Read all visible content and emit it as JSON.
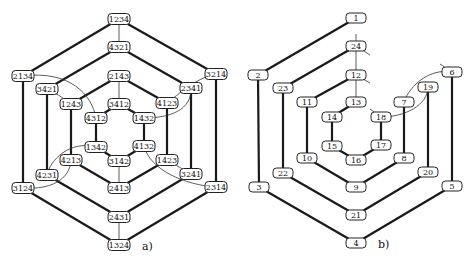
{
  "diagram_a": {
    "caption": "a)",
    "nodes": [
      {
        "id": "1234",
        "label": "1234",
        "x": 119,
        "y": 19
      },
      {
        "id": "4321",
        "label": "4321",
        "x": 119,
        "y": 47
      },
      {
        "id": "2134",
        "label": "2134",
        "x": 23,
        "y": 76
      },
      {
        "id": "3214",
        "label": "3214",
        "x": 216,
        "y": 74
      },
      {
        "id": "2143",
        "label": "2143",
        "x": 119,
        "y": 76
      },
      {
        "id": "3421",
        "label": "3421",
        "x": 47,
        "y": 89
      },
      {
        "id": "2341",
        "label": "2341",
        "x": 191,
        "y": 88
      },
      {
        "id": "1243",
        "label": "1243",
        "x": 71,
        "y": 104
      },
      {
        "id": "3412",
        "label": "3412",
        "x": 119,
        "y": 104
      },
      {
        "id": "4123",
        "label": "4123",
        "x": 167,
        "y": 103
      },
      {
        "id": "4312",
        "label": "4312",
        "x": 96,
        "y": 118
      },
      {
        "id": "1432",
        "label": "1432",
        "x": 144,
        "y": 118
      },
      {
        "id": "1342",
        "label": "1342",
        "x": 96,
        "y": 147
      },
      {
        "id": "4132",
        "label": "4132",
        "x": 144,
        "y": 146
      },
      {
        "id": "4213",
        "label": "4213",
        "x": 71,
        "y": 160
      },
      {
        "id": "3142",
        "label": "3142",
        "x": 119,
        "y": 161
      },
      {
        "id": "1423",
        "label": "1423",
        "x": 167,
        "y": 160
      },
      {
        "id": "4231",
        "label": "4231",
        "x": 47,
        "y": 175
      },
      {
        "id": "3241",
        "label": "3241",
        "x": 191,
        "y": 174
      },
      {
        "id": "3124",
        "label": "3124",
        "x": 23,
        "y": 188
      },
      {
        "id": "2413",
        "label": "2413",
        "x": 119,
        "y": 188
      },
      {
        "id": "2314",
        "label": "2314",
        "x": 216,
        "y": 187
      },
      {
        "id": "2431",
        "label": "2431",
        "x": 119,
        "y": 217
      },
      {
        "id": "1324",
        "label": "1324",
        "x": 119,
        "y": 245
      }
    ]
  },
  "diagram_b": {
    "caption": "b)",
    "nodes": [
      {
        "id": "1",
        "label": "1",
        "x": 356,
        "y": 18
      },
      {
        "id": "24",
        "label": "24",
        "x": 356,
        "y": 46
      },
      {
        "id": "2",
        "label": "2",
        "x": 258,
        "y": 75
      },
      {
        "id": "6",
        "label": "6",
        "x": 452,
        "y": 72
      },
      {
        "id": "12",
        "label": "12",
        "x": 356,
        "y": 75
      },
      {
        "id": "23",
        "label": "23",
        "x": 283,
        "y": 88
      },
      {
        "id": "19",
        "label": "19",
        "x": 428,
        "y": 87
      },
      {
        "id": "11",
        "label": "11",
        "x": 307,
        "y": 102
      },
      {
        "id": "13",
        "label": "13",
        "x": 356,
        "y": 102
      },
      {
        "id": "7",
        "label": "7",
        "x": 404,
        "y": 102
      },
      {
        "id": "14",
        "label": "14",
        "x": 332,
        "y": 117
      },
      {
        "id": "18",
        "label": "18",
        "x": 381,
        "y": 117
      },
      {
        "id": "15",
        "label": "15",
        "x": 332,
        "y": 146
      },
      {
        "id": "17",
        "label": "17",
        "x": 381,
        "y": 145
      },
      {
        "id": "10",
        "label": "10",
        "x": 307,
        "y": 158
      },
      {
        "id": "16",
        "label": "16",
        "x": 356,
        "y": 160
      },
      {
        "id": "8",
        "label": "8",
        "x": 404,
        "y": 158
      },
      {
        "id": "22",
        "label": "22",
        "x": 283,
        "y": 173
      },
      {
        "id": "20",
        "label": "20",
        "x": 428,
        "y": 172
      },
      {
        "id": "3",
        "label": "3",
        "x": 259,
        "y": 187
      },
      {
        "id": "9",
        "label": "9",
        "x": 356,
        "y": 187
      },
      {
        "id": "5",
        "label": "5",
        "x": 452,
        "y": 186
      },
      {
        "id": "21",
        "label": "21",
        "x": 356,
        "y": 215
      },
      {
        "id": "4",
        "label": "4",
        "x": 356,
        "y": 243
      }
    ]
  }
}
